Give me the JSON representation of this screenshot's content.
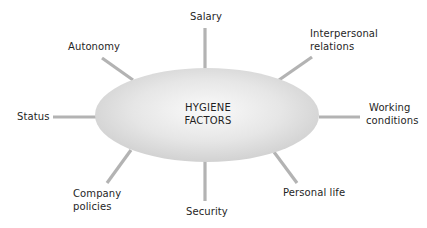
{
  "diagram": {
    "type": "hub-and-spoke",
    "center": {
      "line1": "HYGIENE",
      "line2": "FACTORS"
    },
    "colors": {
      "ellipse_fill_center": "#f7f7f7",
      "ellipse_fill_edge": "#cfcfcf",
      "spoke": "#b3b3b3",
      "text": "#1f1f1f",
      "background": "#ffffff"
    },
    "factors": [
      {
        "id": "salary",
        "line1": "Salary",
        "line2": ""
      },
      {
        "id": "autonomy",
        "line1": "Autonomy",
        "line2": ""
      },
      {
        "id": "interpersonal-relations",
        "line1": "Interpersonal",
        "line2": "relations"
      },
      {
        "id": "status",
        "line1": "Status",
        "line2": ""
      },
      {
        "id": "working-conditions",
        "line1": "Working",
        "line2": "conditions"
      },
      {
        "id": "company-policies",
        "line1": "Company",
        "line2": "policies"
      },
      {
        "id": "security",
        "line1": "Security",
        "line2": ""
      },
      {
        "id": "personal-life",
        "line1": "Personal life",
        "line2": ""
      }
    ]
  }
}
